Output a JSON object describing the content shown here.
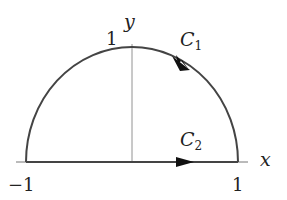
{
  "diagram": {
    "labels": {
      "y_axis": "y",
      "x_axis": "x",
      "y_tick_1": "1",
      "x_tick_neg1": "−1",
      "x_tick_1": "1",
      "c1_main": "C",
      "c1_sub": "1",
      "c2_main": "C",
      "c2_sub": "2"
    },
    "colors": {
      "curve": "#444444",
      "axis": "#777777",
      "arrow": "#111111"
    }
  }
}
